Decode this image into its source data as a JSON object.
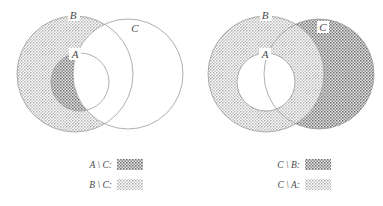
{
  "figure": {
    "background_color": "#ffffff",
    "outline_color": "#9a9a9a",
    "text_color": "#4a4a4a"
  },
  "shading": {
    "light_gray": "#b9b9b9",
    "dark_gray": "#8a8a8a",
    "white": "#ffffff",
    "hatch_description": "fine cross-hatch / stipple texture"
  },
  "left_diagram": {
    "name": "A and B minus C",
    "set_labels": [
      {
        "id": "B",
        "text": "B",
        "x": 73,
        "y": 17
      },
      {
        "id": "A",
        "text": "A",
        "x": 75,
        "y": 56
      },
      {
        "id": "C",
        "text": "C",
        "x": 134,
        "y": 30
      }
    ],
    "circles": [
      {
        "id": "B",
        "cx": 75,
        "cy": 74,
        "r": 58,
        "role": "outer-set-B"
      },
      {
        "id": "A",
        "cx": 80,
        "cy": 82,
        "r": 29,
        "role": "inner-set-A"
      },
      {
        "id": "C",
        "cx": 128,
        "cy": 74,
        "r": 55,
        "role": "set-C"
      }
    ],
    "shaded_regions": [
      {
        "id": "A-minus-C",
        "expression": "A \\ C",
        "fill": "dark_gray"
      },
      {
        "id": "B-minus-C",
        "expression": "B \\ C",
        "fill": "light_gray"
      }
    ],
    "legend": [
      {
        "id": "legend-a-minus-c",
        "label": "A \\ C:",
        "fill": "dark_gray"
      },
      {
        "id": "legend-b-minus-c",
        "label": "B \\ C:",
        "fill": "light_gray"
      }
    ]
  },
  "right_diagram": {
    "name": "C minus B and C minus A",
    "set_labels": [
      {
        "id": "B",
        "text": "B",
        "x": 265,
        "y": 17
      },
      {
        "id": "A",
        "text": "A",
        "x": 265,
        "y": 56
      },
      {
        "id": "C",
        "text": "C",
        "x": 322,
        "y": 30
      }
    ],
    "circles": [
      {
        "id": "B",
        "cx": 266,
        "cy": 74,
        "r": 58,
        "role": "outer-set-B"
      },
      {
        "id": "A",
        "cx": 266,
        "cy": 82,
        "r": 29,
        "role": "inner-set-A"
      },
      {
        "id": "C",
        "cx": 319,
        "cy": 74,
        "r": 55,
        "role": "set-C"
      }
    ],
    "shaded_regions": [
      {
        "id": "C-minus-B",
        "expression": "C \\ B",
        "fill": "dark_gray"
      },
      {
        "id": "C-minus-A",
        "expression": "C \\ A",
        "fill": "light_gray"
      }
    ],
    "legend": [
      {
        "id": "legend-c-minus-b",
        "label": "C \\ B:",
        "fill": "dark_gray"
      },
      {
        "id": "legend-c-minus-a",
        "label": "C \\ A:",
        "fill": "light_gray"
      }
    ]
  },
  "legend_layout": {
    "left_label_x": 112,
    "left_swatch_x": 117,
    "right_label_x": 300,
    "right_swatch_x": 305,
    "row1_y": 164,
    "row2_y": 184,
    "swatch_width": 26,
    "swatch_height": 11
  }
}
